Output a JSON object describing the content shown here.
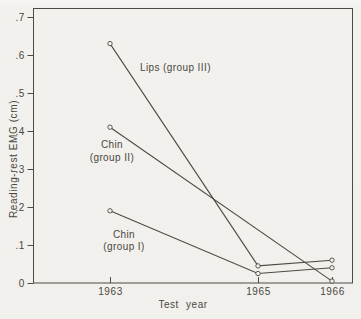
{
  "figure": {
    "background_color": "#f2f1ed",
    "ink_color": "#4e4a45",
    "text_color": "#4b4741"
  },
  "chart_data": {
    "type": "line",
    "title": "",
    "xlabel": "Test year",
    "ylabel": "Reading-rest EMG (cm)",
    "grid": false,
    "legend_position": "none",
    "marker": "open-circle",
    "xlim": [
      1962,
      1966.3
    ],
    "ylim": [
      0,
      0.72
    ],
    "x_ticks": [
      {
        "value": 1963,
        "label": "1963"
      },
      {
        "value": 1965,
        "label": "1965"
      },
      {
        "value": 1966,
        "label": "1966"
      }
    ],
    "y_ticks": [
      {
        "value": 0,
        "label": "0"
      },
      {
        "value": 0.1,
        "label": ".1"
      },
      {
        "value": 0.2,
        "label": ".2"
      },
      {
        "value": 0.3,
        "label": ".3"
      },
      {
        "value": 0.4,
        "label": ".4"
      },
      {
        "value": 0.5,
        "label": ".5"
      },
      {
        "value": 0.6,
        "label": ".6"
      },
      {
        "value": 0.7,
        "label": ".7"
      }
    ],
    "series": [
      {
        "name": "Lips (group III)",
        "points": [
          [
            1963,
            0.63
          ],
          [
            1965,
            0.045
          ],
          [
            1966,
            0.06
          ]
        ]
      },
      {
        "name": "Chin (group II)",
        "points": [
          [
            1963,
            0.41
          ],
          [
            1966,
            0.005
          ]
        ]
      },
      {
        "name": "Chin (group I)",
        "points": [
          [
            1963,
            0.19
          ],
          [
            1965,
            0.025
          ],
          [
            1966,
            0.04
          ]
        ]
      }
    ],
    "annotations": [
      {
        "lines": [
          "Lips (group III)"
        ],
        "x": 140,
        "y": 71,
        "anchor": "start",
        "line_height": 13
      },
      {
        "lines": [
          "Chin",
          "(group II)"
        ],
        "x": 112,
        "y": 148,
        "anchor": "middle",
        "line_height": 13
      },
      {
        "lines": [
          "Chin",
          "(group I)"
        ],
        "x": 124,
        "y": 238,
        "anchor": "middle",
        "line_height": 12
      }
    ],
    "layout": {
      "box": [
        33.5,
        8.5,
        352.5,
        283
      ],
      "x_year0": 1963,
      "x_origin": 110,
      "px_per_year": 74,
      "y_origin": 283,
      "px_per_unit": 380,
      "tick_len": 6,
      "stroke": "#4e4a45",
      "paper": "#f2f1ed"
    }
  }
}
